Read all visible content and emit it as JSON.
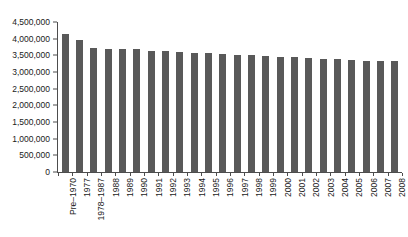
{
  "chart_data": {
    "type": "bar",
    "title": "",
    "subtitle": "",
    "xlabel": "",
    "ylabel": "",
    "ylim": [
      0,
      4500000
    ],
    "ytick_labels": [
      "0",
      "500,000",
      "1,000,000",
      "1,500,000",
      "2,000,000",
      "2,500,000",
      "3,000,000",
      "3,500,000",
      "4,000,000",
      "4,500,000"
    ],
    "ytick_values": [
      0,
      500000,
      1000000,
      1500000,
      2000000,
      2500000,
      3000000,
      3500000,
      4000000,
      4500000
    ],
    "grid": false,
    "legend": false,
    "legend_position": "none",
    "bar_color": "#595959",
    "axis_color": "#4d4d4d",
    "categories": [
      "Pre–1970",
      "1977",
      "1978–1987",
      "1988",
      "1989",
      "1990",
      "1991",
      "1992",
      "1993",
      "1994",
      "1995",
      "1996",
      "1997",
      "1998",
      "1999",
      "2000",
      "2001",
      "2002",
      "2003",
      "2004",
      "2005",
      "2006",
      "2007",
      "2008"
    ],
    "values": [
      4150000,
      3950000,
      3720000,
      3700000,
      3700000,
      3680000,
      3640000,
      3620000,
      3600000,
      3580000,
      3560000,
      3540000,
      3520000,
      3500000,
      3480000,
      3460000,
      3440000,
      3420000,
      3400000,
      3380000,
      3360000,
      3340000,
      3330000,
      3330000
    ]
  }
}
